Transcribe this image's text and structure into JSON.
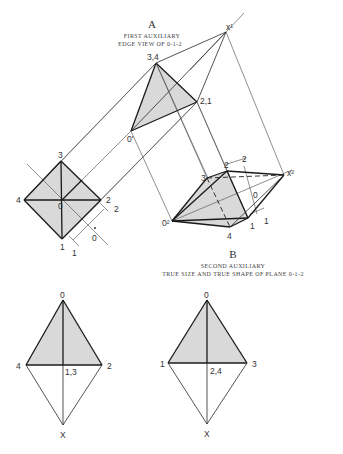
{
  "view_a": {
    "letter": "A",
    "caption_line1": "FIRST AUXILIARY",
    "caption_line2": "EDGE VIEW OF 0-1-2"
  },
  "view_b": {
    "letter": "B",
    "caption_line1": "SECOND AUXILIARY",
    "caption_line2": "TRUE SIZE AND TRUE SHAPE OF PLANE 0-1-2"
  },
  "labels": {
    "first_aux": {
      "x1": "x¹",
      "p34": "3,4",
      "p21": "2,1",
      "p0": "0'"
    },
    "front_view": {
      "p3": "3",
      "p4": "4",
      "p0": "0",
      "p2": "2",
      "p1": "1",
      "ref2": "2",
      "ref0": "0",
      "ref1": "1"
    },
    "second_aux": {
      "p0": "0²",
      "p3": "3",
      "p2": "2",
      "p4": "4",
      "p1": "1",
      "x2": "x²",
      "ref2": "2",
      "ref0": "0",
      "ref1": "1"
    },
    "bottom_left": {
      "top": "0",
      "left": "4",
      "right": "2",
      "center": "1,3",
      "bottom": "X"
    },
    "bottom_right": {
      "top": "0",
      "left": "1",
      "right": "3",
      "center": "2,4",
      "bottom": "X"
    }
  },
  "colors": {
    "shade": "#d9d9d9",
    "line": "#2a2a2a",
    "background": "#ffffff"
  }
}
